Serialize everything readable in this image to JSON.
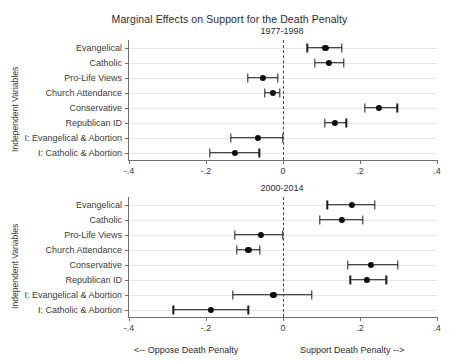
{
  "chart": {
    "type": "scatter",
    "title": "Marginal Effects on Support for the Death Penalty",
    "ylabel": "Independent Variables",
    "footnote_left": "<-- Oppose Death Penalty",
    "footnote_right": "Support Death Penalty -->",
    "xlim": [
      -0.4,
      0.4
    ],
    "xticks": [
      -0.4,
      -0.2,
      0,
      0.4
    ],
    "xtick_labels": [
      "-.4",
      "-.2",
      "0",
      ".2",
      ".4"
    ],
    "xtick_values": [
      -0.4,
      -0.2,
      0,
      0.2,
      0.4
    ],
    "grid": "horizontal",
    "zero_reference": 0,
    "marker_color": "#0d0d0d",
    "grid_color": "#e6e6e6",
    "axis_color": "#6e6e6e"
  },
  "chart_data": [
    {
      "type": "scatter",
      "title": "1977-1998",
      "panel": "top",
      "xlabel": "",
      "ylabel": "Independent Variables",
      "xlim": [
        -0.4,
        0.4
      ],
      "xticks": [
        -0.4,
        -0.2,
        0,
        0.2,
        0.4
      ],
      "xtick_labels": [
        "-.4",
        "-.2",
        "0",
        ".2",
        ".4"
      ],
      "categories": [
        "Evangelical",
        "Catholic",
        "Pro-Life Views",
        "Church Attendance",
        "Conservative",
        "Republican ID",
        "I: Evangelical & Abortion",
        "I: Catholic & Abortion"
      ],
      "estimates": [
        0.11,
        0.12,
        -0.052,
        -0.027,
        0.25,
        0.135,
        -0.065,
        -0.125
      ],
      "ci_low": [
        0.063,
        0.082,
        -0.092,
        -0.047,
        0.212,
        0.108,
        -0.135,
        -0.19
      ],
      "ci_high": [
        0.152,
        0.158,
        -0.013,
        -0.008,
        0.297,
        0.164,
        0.0,
        -0.062
      ]
    },
    {
      "type": "scatter",
      "title": "2000-2014",
      "panel": "bottom",
      "xlabel": "",
      "ylabel": "Independent Variables",
      "xlim": [
        -0.4,
        0.4
      ],
      "xticks": [
        -0.4,
        -0.2,
        0,
        0.2,
        0.4
      ],
      "xtick_labels": [
        "-.4",
        "-.2",
        "0",
        ".2",
        ".4"
      ],
      "categories": [
        "Evangelical",
        "Catholic",
        "Pro-Life Views",
        "Church Attendance",
        "Conservative",
        "Republican ID",
        "I: Evangelical & Abortion",
        "I: Catholic & Abortion"
      ],
      "estimates": [
        0.178,
        0.152,
        -0.058,
        -0.09,
        0.228,
        0.218,
        -0.025,
        -0.188
      ],
      "ci_low": [
        0.115,
        0.095,
        -0.125,
        -0.12,
        0.168,
        0.175,
        -0.13,
        -0.285
      ],
      "ci_high": [
        0.238,
        0.208,
        0.0,
        -0.06,
        0.298,
        0.268,
        0.075,
        -0.09
      ]
    }
  ]
}
